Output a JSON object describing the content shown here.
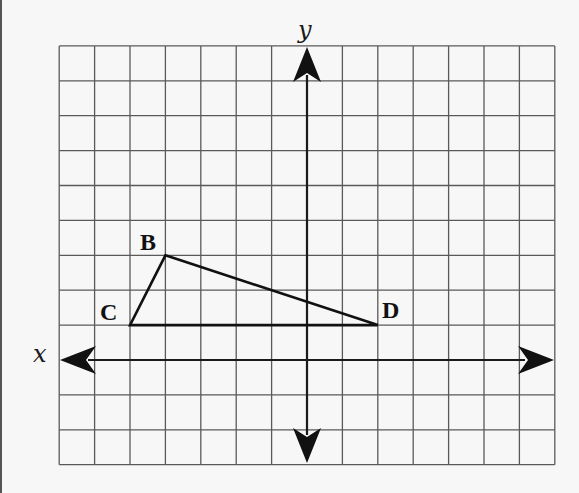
{
  "diagram": {
    "type": "coordinate-plane",
    "grid": {
      "columns": 14,
      "rows": 12,
      "x_range": [
        -7,
        7
      ],
      "y_range": [
        -3,
        9
      ],
      "origin_px": [
        307,
        360
      ],
      "cell_px": [
        35.4,
        34.9
      ],
      "line_color": "#5a5a5a",
      "background": "#f7f7f7"
    },
    "axes": {
      "x_label": "x",
      "y_label": "y",
      "color": "#1a1a1a"
    },
    "points": [
      {
        "label": "B",
        "x": -4,
        "y": 3
      },
      {
        "label": "C",
        "x": -5,
        "y": 1
      },
      {
        "label": "D",
        "x": 2,
        "y": 1
      }
    ],
    "polygon": {
      "name": "triangle BCD",
      "vertices": [
        "B",
        "D",
        "C"
      ],
      "stroke": "#111111"
    }
  }
}
